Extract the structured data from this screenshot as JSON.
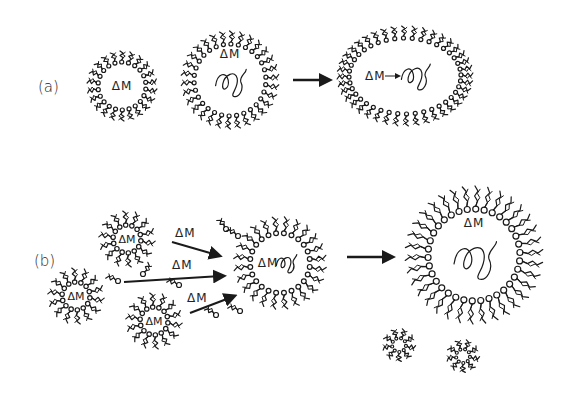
{
  "figure": {
    "background": "#ffffff",
    "ink": "#1a1a1a",
    "panels": [
      {
        "id": "a",
        "label": "(a)",
        "label_pos": [
          50,
          92
        ],
        "micelles": [
          {
            "cx": 122,
            "cy": 86,
            "r": 24,
            "tail": 9,
            "count": 22,
            "label": "ΔM",
            "label_dy": 0,
            "polymer": false
          },
          {
            "cx": 230,
            "cy": 80,
            "r": 36,
            "tail": 11,
            "count": 30,
            "label": "ΔM",
            "label_dy": -26,
            "polymer": true
          }
        ],
        "arrows": [
          {
            "x1": 293,
            "y1": 80,
            "x2": 327,
            "y2": 80,
            "label": ""
          }
        ],
        "merged_micelle": {
          "cx": 405,
          "cy": 76,
          "rx": 56,
          "ry": 38,
          "label": "ΔM",
          "inner_arrow": true
        }
      },
      {
        "id": "b",
        "label": "(b)",
        "label_pos": [
          34,
          262
        ],
        "small_micelles": [
          {
            "cx": 127,
            "cy": 239,
            "r": 14,
            "tail": 12,
            "count": 14,
            "label": "ΔM"
          },
          {
            "cx": 76,
            "cy": 296,
            "r": 14,
            "tail": 12,
            "count": 14,
            "label": "ΔM"
          },
          {
            "cx": 154,
            "cy": 321,
            "r": 14,
            "tail": 12,
            "count": 14,
            "label": "ΔM"
          }
        ],
        "arrows": [
          {
            "x1": 172,
            "y1": 242,
            "x2": 217,
            "y2": 255,
            "label": "ΔM",
            "lx": 175,
            "ly": 237
          },
          {
            "x1": 124,
            "y1": 282,
            "x2": 221,
            "y2": 276,
            "label": "ΔM",
            "lx": 172,
            "ly": 269
          },
          {
            "x1": 190,
            "y1": 313,
            "x2": 232,
            "y2": 297,
            "label": "ΔM",
            "lx": 187,
            "ly": 302
          }
        ],
        "free_surfactants": [
          {
            "x": 118,
            "y": 281,
            "a": 200
          },
          {
            "x": 143,
            "y": 274,
            "a": 300
          },
          {
            "x": 179,
            "y": 285,
            "a": 200
          },
          {
            "x": 226,
            "y": 229,
            "a": 230
          },
          {
            "x": 238,
            "y": 236,
            "a": 210
          },
          {
            "x": 216,
            "y": 315,
            "a": 210
          },
          {
            "x": 240,
            "y": 311,
            "a": 200
          }
        ],
        "mid_micelle": {
          "cx": 280,
          "cy": 263,
          "r": 30,
          "tail": 14,
          "count": 24,
          "label": "ΔM",
          "label_dx": -12
        },
        "big_arrow": {
          "x1": 347,
          "y1": 257,
          "x2": 390,
          "y2": 257
        },
        "big_micelle": {
          "cx": 474,
          "cy": 255,
          "r": 46,
          "tail": 20,
          "count": 34,
          "label": "ΔM"
        },
        "empty_micelles": [
          {
            "cx": 399,
            "cy": 345,
            "r": 7,
            "tail": 8,
            "count": 9
          },
          {
            "cx": 463,
            "cy": 356,
            "r": 7,
            "tail": 8,
            "count": 9
          }
        ]
      }
    ]
  }
}
